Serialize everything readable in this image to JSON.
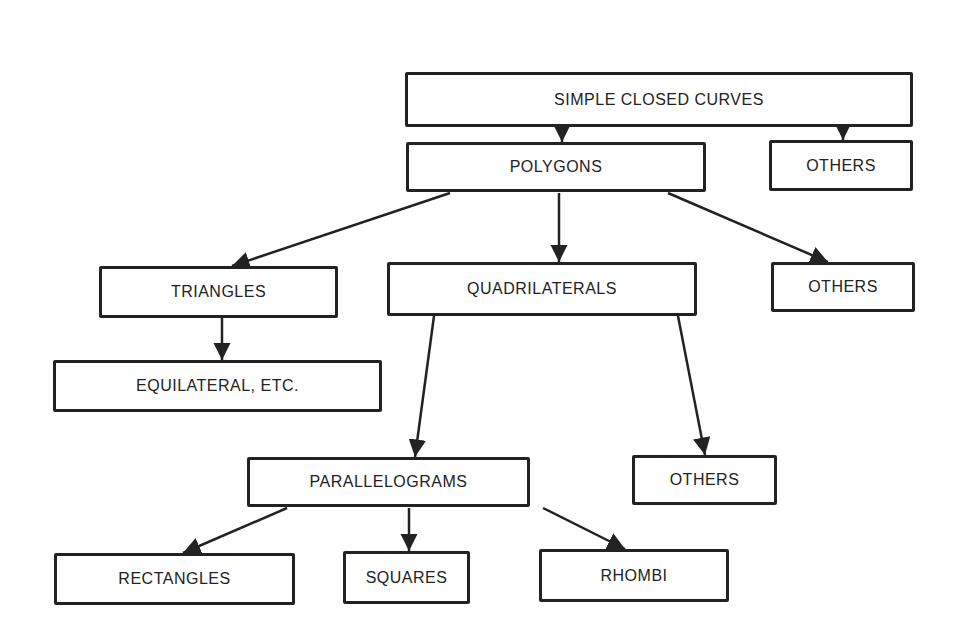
{
  "diagram": {
    "nodes": [
      {
        "id": "simple-closed-curves",
        "label": "SIMPLE CLOSED CURVES",
        "x": 405,
        "y": 72,
        "w": 508,
        "h": 55
      },
      {
        "id": "polygons",
        "label": "POLYGONS",
        "x": 406,
        "y": 142,
        "w": 300,
        "h": 50
      },
      {
        "id": "others-1",
        "label": "OTHERS",
        "x": 769,
        "y": 140,
        "w": 144,
        "h": 51
      },
      {
        "id": "triangles",
        "label": "TRIANGLES",
        "x": 99,
        "y": 266,
        "w": 239,
        "h": 52
      },
      {
        "id": "quadrilaterals",
        "label": "QUADRILATERALS",
        "x": 387,
        "y": 262,
        "w": 310,
        "h": 54
      },
      {
        "id": "others-2",
        "label": "OTHERS",
        "x": 771,
        "y": 262,
        "w": 144,
        "h": 50
      },
      {
        "id": "equilateral-etc",
        "label": "EQUILATERAL, ETC.",
        "x": 53,
        "y": 360,
        "w": 329,
        "h": 52
      },
      {
        "id": "parallelograms",
        "label": "PARALLELOGRAMS",
        "x": 247,
        "y": 457,
        "w": 283,
        "h": 50
      },
      {
        "id": "others-3",
        "label": "OTHERS",
        "x": 632,
        "y": 455,
        "w": 145,
        "h": 50
      },
      {
        "id": "rectangles",
        "label": "RECTANGLES",
        "x": 54,
        "y": 553,
        "w": 241,
        "h": 52
      },
      {
        "id": "squares",
        "label": "SQUARES",
        "x": 343,
        "y": 551,
        "w": 127,
        "h": 53
      },
      {
        "id": "rhombi",
        "label": "RHOMBI",
        "x": 539,
        "y": 549,
        "w": 190,
        "h": 53
      }
    ],
    "edges": [
      {
        "from": "simple-closed-curves",
        "to": "polygons",
        "x1": 562,
        "y1": 127,
        "x2": 562,
        "y2": 142
      },
      {
        "from": "simple-closed-curves",
        "to": "others-1",
        "x1": 843,
        "y1": 127,
        "x2": 843,
        "y2": 140
      },
      {
        "from": "polygons",
        "to": "triangles",
        "x1": 450,
        "y1": 193,
        "x2": 232,
        "y2": 266
      },
      {
        "from": "polygons",
        "to": "quadrilaterals",
        "x1": 559,
        "y1": 193,
        "x2": 559,
        "y2": 262
      },
      {
        "from": "polygons",
        "to": "others-2",
        "x1": 668,
        "y1": 193,
        "x2": 828,
        "y2": 262
      },
      {
        "from": "triangles",
        "to": "equilateral-etc",
        "x1": 222,
        "y1": 318,
        "x2": 222,
        "y2": 360
      },
      {
        "from": "quadrilaterals",
        "to": "parallelograms",
        "x1": 434,
        "y1": 316,
        "x2": 415,
        "y2": 457
      },
      {
        "from": "quadrilaterals",
        "to": "others-3",
        "x1": 678,
        "y1": 316,
        "x2": 705,
        "y2": 455
      },
      {
        "from": "parallelograms",
        "to": "rectangles",
        "x1": 287,
        "y1": 508,
        "x2": 183,
        "y2": 553
      },
      {
        "from": "parallelograms",
        "to": "squares",
        "x1": 409,
        "y1": 508,
        "x2": 409,
        "y2": 551
      },
      {
        "from": "parallelograms",
        "to": "rhombi",
        "x1": 543,
        "y1": 508,
        "x2": 625,
        "y2": 549
      }
    ],
    "colors": {
      "line": "#222222",
      "background": "#ffffff"
    }
  }
}
